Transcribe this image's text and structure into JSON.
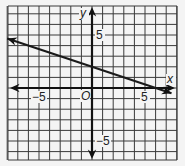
{
  "chart_data": {
    "type": "line",
    "title": "",
    "xlabel": "x",
    "ylabel": "y",
    "origin_label": "O",
    "xlim": [
      -8,
      8
    ],
    "ylim": [
      -7.5,
      7.5
    ],
    "grid": true,
    "x_tick_labels": [
      {
        "value": -5,
        "label": "−5"
      },
      {
        "value": 5,
        "label": "5"
      }
    ],
    "y_tick_labels": [
      {
        "value": 5,
        "label": "5"
      },
      {
        "value": -5,
        "label": "−5"
      }
    ],
    "series": [
      {
        "name": "line",
        "equation": "y = -x/3 + 2",
        "slope": -0.3333,
        "y_intercept": 2,
        "x_intercept": 6,
        "x": [
          -8,
          7.5
        ],
        "y": [
          4.67,
          -0.5
        ],
        "arrows_both_ends": true
      }
    ]
  },
  "colors": {
    "background": "#f4f4f4",
    "grid": "#3a3a3a",
    "axis": "#111111",
    "line": "#1a1a1a"
  }
}
